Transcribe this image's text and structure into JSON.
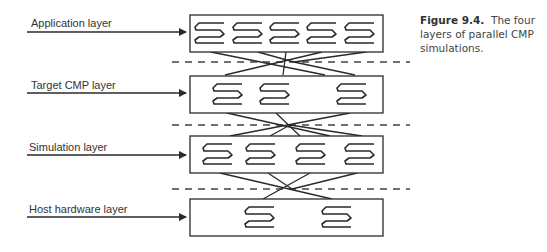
{
  "caption": {
    "figure_number": "Figure 9.4.",
    "text": "The four layers of parallel CMP simulations."
  },
  "layers": [
    {
      "label": "Application layer",
      "thread_count": 5
    },
    {
      "label": "Target CMP layer",
      "thread_count": 3
    },
    {
      "label": "Simulation layer",
      "thread_count": 4
    },
    {
      "label": "Host hardware layer",
      "thread_count": 2
    }
  ],
  "colors": {
    "stroke": "#2a2a2a",
    "text": "#333333",
    "background": "#ffffff"
  }
}
